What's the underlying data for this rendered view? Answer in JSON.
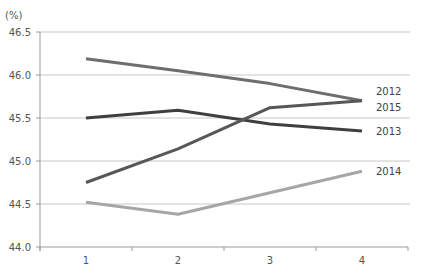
{
  "chart_data": {
    "type": "line",
    "title": "",
    "xlabel": "",
    "ylabel": "(%)",
    "ylim": [
      44.0,
      46.5
    ],
    "yticks": [
      "44.0",
      "44.5",
      "45.0",
      "45.5",
      "46.0",
      "46.5"
    ],
    "categories": [
      "1",
      "2",
      "3",
      "4"
    ],
    "grid": true,
    "legend_position": "inline-right",
    "series": [
      {
        "name": "2012",
        "values": [
          46.19,
          46.05,
          45.9,
          45.7
        ],
        "color": "#6e6e6e"
      },
      {
        "name": "2013",
        "values": [
          45.5,
          45.59,
          45.43,
          45.35
        ],
        "color": "#3f3f3f"
      },
      {
        "name": "2014",
        "values": [
          44.52,
          44.38,
          44.63,
          44.88
        ],
        "color": "#a6a6a6"
      },
      {
        "name": "2015",
        "values": [
          44.75,
          45.14,
          45.62,
          45.7
        ],
        "color": "#575757"
      }
    ],
    "label_offsets": {
      "2012": -10,
      "2013": 0,
      "2014": 0,
      "2015": 6
    }
  }
}
